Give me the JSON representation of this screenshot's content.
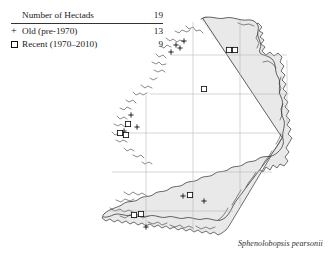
{
  "legend": {
    "title_label": "Number of Hectads",
    "title_count": "19",
    "rows": [
      {
        "symbol": "plus-symbol",
        "label": "Old  (pre-1970)",
        "count": "13"
      },
      {
        "symbol": "square-symbol",
        "label": "Recent (1970–2010)",
        "count": "9"
      }
    ]
  },
  "caption": {
    "species": "Sphenolobopsis pearsonii"
  },
  "colors": {
    "land_fill": "#e9e9e9",
    "coastline": "#333333",
    "grid": "#b9b9b9",
    "marker": "#111111",
    "text": "#1a1a1a"
  },
  "map": {
    "region_name": "Ireland",
    "grid": {
      "vertical_x": [
        146,
        193,
        240,
        287
      ],
      "horizontal_y": [
        55,
        94,
        133,
        172,
        211
      ]
    },
    "markers": [
      {
        "type": "plus",
        "x": 176,
        "y": 45
      },
      {
        "type": "plus",
        "x": 180,
        "y": 48
      },
      {
        "type": "plus",
        "x": 184,
        "y": 41
      },
      {
        "type": "plus",
        "x": 171,
        "y": 52
      },
      {
        "type": "square",
        "x": 229,
        "y": 50
      },
      {
        "type": "square",
        "x": 235,
        "y": 50
      },
      {
        "type": "square",
        "x": 204,
        "y": 89
      },
      {
        "type": "plus",
        "x": 131,
        "y": 115
      },
      {
        "type": "square",
        "x": 128,
        "y": 124
      },
      {
        "type": "plus",
        "x": 137,
        "y": 127
      },
      {
        "type": "plus",
        "x": 124,
        "y": 131
      },
      {
        "type": "square",
        "x": 120,
        "y": 133
      },
      {
        "type": "square",
        "x": 126,
        "y": 135
      },
      {
        "type": "plus",
        "x": 183,
        "y": 196
      },
      {
        "type": "square",
        "x": 190,
        "y": 195
      },
      {
        "type": "plus",
        "x": 204,
        "y": 201
      },
      {
        "type": "square",
        "x": 134,
        "y": 215
      },
      {
        "type": "square",
        "x": 141,
        "y": 214
      },
      {
        "type": "plus",
        "x": 146,
        "y": 227
      }
    ]
  }
}
